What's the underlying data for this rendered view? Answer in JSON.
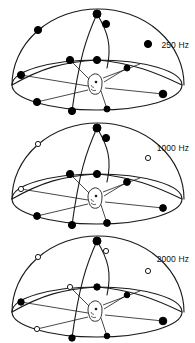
{
  "figure": {
    "background_color": "#ffffff",
    "line_color": "#1a1a1a",
    "marker_filled_color": "#000000",
    "marker_open_color": "#ffffff"
  },
  "chart_data": {
    "type": "scatter",
    "xlabel": "",
    "ylabel": "",
    "legend": [
      {
        "marker": "filled",
        "label": "filled circle"
      },
      {
        "marker": "open",
        "label": "open circle"
      }
    ],
    "panels": [
      {
        "label": "250 Hz",
        "points": [
          {
            "x": 97,
            "y": 12,
            "fill": "filled"
          },
          {
            "x": 106,
            "y": 22,
            "fill": "filled"
          },
          {
            "x": 38,
            "y": 28,
            "fill": "filled"
          },
          {
            "x": 148,
            "y": 42,
            "fill": "filled"
          },
          {
            "x": 70,
            "y": 58,
            "fill": "filled"
          },
          {
            "x": 97,
            "y": 58,
            "fill": "filled"
          },
          {
            "x": 21,
            "y": 73,
            "fill": "filled"
          },
          {
            "x": 127,
            "y": 66,
            "fill": "filled"
          },
          {
            "x": 163,
            "y": 92,
            "fill": "filled"
          },
          {
            "x": 37,
            "y": 100,
            "fill": "filled"
          },
          {
            "x": 72,
            "y": 109,
            "fill": "filled"
          },
          {
            "x": 107,
            "y": 107,
            "fill": "filled"
          }
        ]
      },
      {
        "label": "1000 Hz",
        "points": [
          {
            "x": 97,
            "y": 12,
            "fill": "filled"
          },
          {
            "x": 106,
            "y": 22,
            "fill": "filled"
          },
          {
            "x": 38,
            "y": 28,
            "fill": "open"
          },
          {
            "x": 148,
            "y": 42,
            "fill": "open"
          },
          {
            "x": 70,
            "y": 58,
            "fill": "filled"
          },
          {
            "x": 97,
            "y": 58,
            "fill": "filled"
          },
          {
            "x": 21,
            "y": 73,
            "fill": "open"
          },
          {
            "x": 127,
            "y": 66,
            "fill": "filled"
          },
          {
            "x": 163,
            "y": 92,
            "fill": "filled"
          },
          {
            "x": 37,
            "y": 100,
            "fill": "filled"
          },
          {
            "x": 72,
            "y": 109,
            "fill": "filled"
          },
          {
            "x": 107,
            "y": 107,
            "fill": "filled"
          }
        ]
      },
      {
        "label": "2000 Hz",
        "points": [
          {
            "x": 97,
            "y": 12,
            "fill": "filled"
          },
          {
            "x": 106,
            "y": 22,
            "fill": "open"
          },
          {
            "x": 38,
            "y": 28,
            "fill": "open"
          },
          {
            "x": 148,
            "y": 42,
            "fill": "open"
          },
          {
            "x": 70,
            "y": 58,
            "fill": "open"
          },
          {
            "x": 97,
            "y": 58,
            "fill": "filled"
          },
          {
            "x": 21,
            "y": 73,
            "fill": "filled"
          },
          {
            "x": 127,
            "y": 66,
            "fill": "filled"
          },
          {
            "x": 163,
            "y": 92,
            "fill": "filled"
          },
          {
            "x": 37,
            "y": 100,
            "fill": "open"
          },
          {
            "x": 72,
            "y": 109,
            "fill": "filled"
          },
          {
            "x": 107,
            "y": 107,
            "fill": "filled"
          }
        ]
      }
    ]
  },
  "panels": [
    {
      "id": "panel-250",
      "label": "250 Hz"
    },
    {
      "id": "panel-1000",
      "label": "1000 Hz"
    },
    {
      "id": "panel-2000",
      "label": "2000 Hz"
    }
  ]
}
